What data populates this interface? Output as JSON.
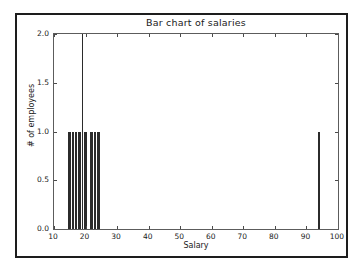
{
  "figure": {
    "background_color": "#ffffff",
    "frame_color": "#1d1d1d",
    "axes_frame_color": "#5c5c5c"
  },
  "chart_data": {
    "type": "bar",
    "title": "Bar chart of salaries",
    "xlabel": "Salary",
    "ylabel": "# of employees",
    "xlim": [
      10,
      100
    ],
    "ylim": [
      0.0,
      2.0
    ],
    "grid": false,
    "legend": null,
    "bar_color": "#2b2b2b",
    "xticks": [
      10,
      20,
      30,
      40,
      50,
      60,
      70,
      80,
      90,
      100
    ],
    "xticklabels": [
      "10",
      "20",
      "30",
      "40",
      "50",
      "60",
      "70",
      "80",
      "90",
      "100"
    ],
    "yticks": [
      0.0,
      0.5,
      1.0,
      1.5,
      2.0
    ],
    "yticklabels": [
      "0.0",
      "0.5",
      "1.0",
      "1.5",
      "2.0"
    ],
    "bar_width": 0.9,
    "x": [
      15,
      16,
      17,
      18,
      19,
      20,
      22,
      23,
      24,
      94
    ],
    "values": [
      1,
      1,
      1,
      1,
      2,
      1,
      1,
      1,
      1,
      1
    ],
    "bars": [
      {
        "x": 15,
        "value": 1,
        "width": 0.9
      },
      {
        "x": 16,
        "value": 1,
        "width": 0.9
      },
      {
        "x": 17,
        "value": 1,
        "width": 0.9
      },
      {
        "x": 18,
        "value": 1,
        "width": 0.9
      },
      {
        "x": 19,
        "value": 2,
        "width": 0.35
      },
      {
        "x": 20,
        "value": 1,
        "width": 0.9
      },
      {
        "x": 22,
        "value": 1,
        "width": 0.9
      },
      {
        "x": 23,
        "value": 1,
        "width": 0.9
      },
      {
        "x": 24,
        "value": 1,
        "width": 0.9
      },
      {
        "x": 94,
        "value": 1,
        "width": 0.9
      }
    ]
  }
}
